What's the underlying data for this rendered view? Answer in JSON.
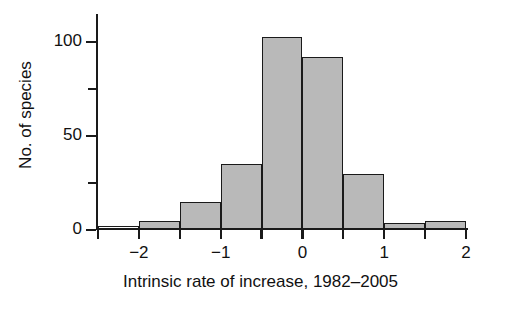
{
  "chart_data": {
    "type": "bar",
    "title": "",
    "subtitle": "",
    "xlabel": "Intrinsic rate of increase, 1982–2005",
    "ylabel": "No. of species",
    "xlim": [
      -2.5,
      2.0
    ],
    "ylim": [
      0,
      115
    ],
    "grid": false,
    "legend": null,
    "bin_width": 0.5,
    "bin_edges": [
      -2.5,
      -2.0,
      -1.5,
      -1.0,
      -0.5,
      0.0,
      0.5,
      1.0,
      1.5,
      2.0
    ],
    "categories": [
      "-2.5 to -2.0",
      "-2.0 to -1.5",
      "-1.5 to -1.0",
      "-1.0 to -0.5",
      "-0.5 to 0.0",
      "0.0 to 0.5",
      "0.5 to 1.0",
      "1.0 to 1.5",
      "1.5 to 2.0"
    ],
    "values": [
      2,
      5,
      15,
      35,
      103,
      92,
      30,
      4,
      5
    ],
    "bar_fill": [
      "#ffffff",
      "#b9b9b9",
      "#b9b9b9",
      "#b9b9b9",
      "#b9b9b9",
      "#b9b9b9",
      "#b9b9b9",
      "#b9b9b9",
      "#b9b9b9"
    ],
    "bar_edge_color": "#1a1a1a",
    "x_ticks": [
      -2.5,
      -2.0,
      -1.5,
      -1.0,
      -0.5,
      0.0,
      0.5,
      1.0,
      1.5,
      2.0
    ],
    "x_tick_labels": [
      {
        "value": -2,
        "label": "−2"
      },
      {
        "value": -1,
        "label": "−1"
      },
      {
        "value": 0,
        "label": "0"
      },
      {
        "value": 1,
        "label": "1"
      },
      {
        "value": 2,
        "label": "2"
      }
    ],
    "y_ticks": [
      0,
      25,
      50,
      75,
      100
    ],
    "y_tick_labels": [
      {
        "value": 0,
        "label": "0"
      },
      {
        "value": 25,
        "label": ""
      },
      {
        "value": 50,
        "label": "50"
      },
      {
        "value": 75,
        "label": ""
      },
      {
        "value": 100,
        "label": "100"
      }
    ]
  },
  "axis_titles": {
    "x": "Intrinsic rate of increase, 1982–2005",
    "y": "No. of species"
  }
}
